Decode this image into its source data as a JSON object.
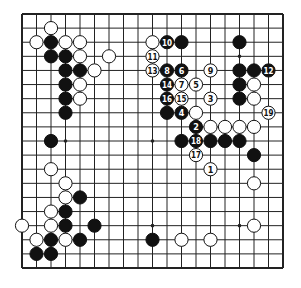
{
  "diagram": {
    "type": "go-board",
    "size": 19,
    "colors": {
      "line": "#222222",
      "black_stone": "#111111",
      "white_stone": "#ffffff",
      "background": "#ffffff"
    },
    "star_points": [
      [
        3,
        3
      ],
      [
        9,
        3
      ],
      [
        15,
        3
      ],
      [
        3,
        9
      ],
      [
        9,
        9
      ],
      [
        15,
        9
      ],
      [
        3,
        15
      ],
      [
        9,
        15
      ],
      [
        15,
        15
      ]
    ],
    "black_stones": [
      [
        2,
        2
      ],
      [
        2,
        3
      ],
      [
        3,
        3
      ],
      [
        3,
        4
      ],
      [
        4,
        4
      ],
      [
        3,
        5
      ],
      [
        3,
        6
      ],
      [
        3,
        7
      ],
      [
        11,
        2
      ],
      [
        15,
        2
      ],
      [
        15,
        4
      ],
      [
        16,
        4
      ],
      [
        15,
        5
      ],
      [
        15,
        6
      ],
      [
        10,
        7
      ],
      [
        11,
        9
      ],
      [
        13,
        9
      ],
      [
        14,
        9
      ],
      [
        15,
        9
      ],
      [
        16,
        10
      ],
      [
        2,
        9
      ],
      [
        4,
        13
      ],
      [
        3,
        14
      ],
      [
        3,
        15
      ],
      [
        5,
        15
      ],
      [
        2,
        16
      ],
      [
        4,
        16
      ],
      [
        1,
        17
      ],
      [
        2,
        17
      ],
      [
        9,
        16
      ]
    ],
    "white_stones": [
      [
        2,
        1
      ],
      [
        1,
        2
      ],
      [
        3,
        2
      ],
      [
        4,
        2
      ],
      [
        4,
        3
      ],
      [
        6,
        3
      ],
      [
        5,
        4
      ],
      [
        4,
        5
      ],
      [
        4,
        6
      ],
      [
        9,
        2
      ],
      [
        12,
        7
      ],
      [
        16,
        5
      ],
      [
        16,
        6
      ],
      [
        13,
        8
      ],
      [
        14,
        8
      ],
      [
        15,
        8
      ],
      [
        16,
        8
      ],
      [
        16,
        12
      ],
      [
        16,
        15
      ],
      [
        11,
        16
      ],
      [
        13,
        16
      ],
      [
        2,
        11
      ],
      [
        3,
        12
      ],
      [
        3,
        13
      ],
      [
        2,
        14
      ],
      [
        0,
        15
      ],
      [
        2,
        15
      ],
      [
        1,
        16
      ],
      [
        3,
        16
      ]
    ],
    "numbered_moves": [
      {
        "n": "1",
        "color": "white",
        "pos": [
          13,
          11
        ]
      },
      {
        "n": "2",
        "color": "black",
        "pos": [
          12,
          8
        ]
      },
      {
        "n": "3",
        "color": "white",
        "pos": [
          13,
          6
        ]
      },
      {
        "n": "4",
        "color": "black",
        "pos": [
          11,
          7
        ]
      },
      {
        "n": "5",
        "color": "white",
        "pos": [
          12,
          5
        ]
      },
      {
        "n": "6",
        "color": "black",
        "pos": [
          11,
          4
        ]
      },
      {
        "n": "7",
        "color": "white",
        "pos": [
          11,
          5
        ]
      },
      {
        "n": "8",
        "color": "black",
        "pos": [
          10,
          4
        ]
      },
      {
        "n": "9",
        "color": "white",
        "pos": [
          13,
          4
        ]
      },
      {
        "n": "10",
        "color": "black",
        "pos": [
          10,
          2
        ]
      },
      {
        "n": "11",
        "color": "white",
        "pos": [
          9,
          3
        ]
      },
      {
        "n": "12",
        "color": "black",
        "pos": [
          17,
          4
        ]
      },
      {
        "n": "13",
        "color": "white",
        "pos": [
          9,
          4
        ]
      },
      {
        "n": "14",
        "color": "black",
        "pos": [
          10,
          5
        ]
      },
      {
        "n": "15",
        "color": "white",
        "pos": [
          11,
          6
        ]
      },
      {
        "n": "16",
        "color": "black",
        "pos": [
          10,
          6
        ]
      },
      {
        "n": "17",
        "color": "white",
        "pos": [
          12,
          10
        ]
      },
      {
        "n": "18",
        "color": "black",
        "pos": [
          12,
          9
        ]
      },
      {
        "n": "19",
        "color": "white",
        "pos": [
          17,
          7
        ]
      }
    ]
  }
}
